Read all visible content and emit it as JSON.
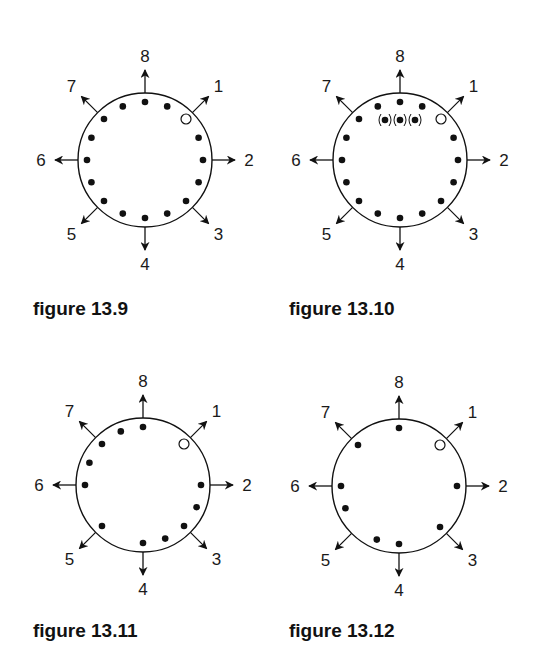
{
  "style": {
    "ink": "#111111",
    "background": "#ffffff"
  },
  "geometry": {
    "circle_radius": 67,
    "dot_radius": 58,
    "arrow_start": 67,
    "arrow_end": 90,
    "label_radius": 104,
    "direction_angles_deg": {
      "8": 0,
      "1": 45,
      "2": 90,
      "3": 135,
      "4": 180,
      "5": 225,
      "6": 270,
      "7": 315
    }
  },
  "direction_labels": [
    "1",
    "2",
    "3",
    "4",
    "5",
    "6",
    "7",
    "8"
  ],
  "figures": [
    {
      "id": "fig-13-9",
      "caption": "figure 13.9",
      "center": [
        145,
        160
      ],
      "caption_pos": [
        33,
        298
      ],
      "open_circle_angle": 45,
      "dot_angles": [
        0,
        22.5,
        67.5,
        90,
        112.5,
        135,
        157.5,
        180,
        202.5,
        225,
        247.5,
        270,
        292.5,
        315,
        337.5
      ],
      "parenthesized_dots": []
    },
    {
      "id": "fig-13-10",
      "caption": "figure 13.10",
      "center": [
        400,
        160
      ],
      "caption_pos": [
        289,
        298
      ],
      "open_circle_angle": 45,
      "dot_angles": [
        0,
        22.5,
        67.5,
        90,
        112.5,
        135,
        157.5,
        180,
        202.5,
        225,
        247.5,
        270,
        292.5,
        315,
        337.5
      ],
      "parenthesized_dots": [
        [
          -15,
          -40
        ],
        [
          0,
          -40
        ],
        [
          15,
          -40
        ]
      ]
    },
    {
      "id": "fig-13-11",
      "caption": "figure 13.11",
      "center": [
        143,
        485
      ],
      "caption_pos": [
        33,
        620
      ],
      "open_circle_angle": 45,
      "dot_angles": [
        0,
        90,
        112.5,
        135,
        157.5,
        180,
        225,
        270,
        292.5,
        315,
        337.5
      ],
      "parenthesized_dots": []
    },
    {
      "id": "fig-13-12",
      "caption": "figure 13.12",
      "center": [
        399,
        486
      ],
      "caption_pos": [
        289,
        620
      ],
      "open_circle_angle": 45,
      "dot_angles": [
        0,
        90,
        135,
        180,
        202.5,
        247.5,
        270,
        315
      ],
      "parenthesized_dots": []
    }
  ]
}
